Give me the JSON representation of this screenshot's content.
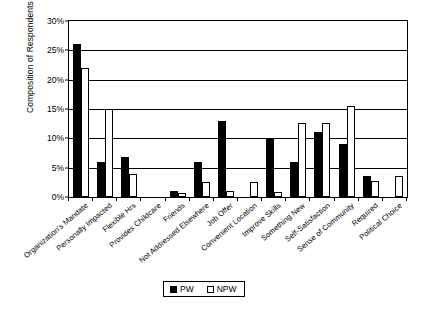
{
  "chart_data": {
    "type": "bar",
    "title": "",
    "xlabel": "",
    "ylabel": "Composition of Respondents",
    "ylim": [
      0,
      30
    ],
    "ytick_labels": [
      "30%",
      "25%",
      "20%",
      "15%",
      "10%",
      "5%",
      "0%"
    ],
    "ytick_values": [
      30,
      25,
      20,
      15,
      10,
      5,
      0
    ],
    "grid": true,
    "legend_position": "bottom-center",
    "categories": [
      "Organization's Mandate",
      "Personally Impacted",
      "Flexible Hrs",
      "Provides Childcare",
      "Friends",
      "Not Addressed Elsewhere",
      "Job Offer",
      "Convenient Location",
      "Improve Skills",
      "Something New",
      "Self-Satisfaction",
      "Sense of Community",
      "Required",
      "Political Choice"
    ],
    "series": [
      {
        "name": "PW",
        "color": "#000000",
        "values": [
          26.0,
          6.0,
          6.8,
          0.0,
          1.0,
          6.0,
          13.0,
          0.0,
          10.0,
          6.0,
          11.0,
          9.0,
          3.5,
          0.0
        ]
      },
      {
        "name": "NPW",
        "color": "#FFFFFF",
        "values": [
          22.0,
          15.0,
          4.0,
          0.0,
          0.6,
          2.6,
          1.0,
          2.5,
          0.8,
          12.7,
          12.7,
          15.5,
          2.8,
          3.5
        ]
      }
    ]
  },
  "legend": {
    "entries": [
      {
        "label": "PW",
        "swatch": "filled-black-square"
      },
      {
        "label": "NPW",
        "swatch": "empty-white-square"
      }
    ]
  }
}
